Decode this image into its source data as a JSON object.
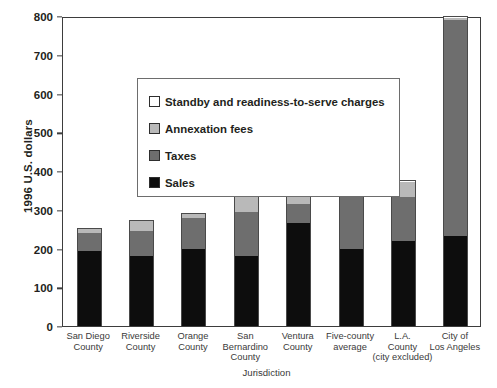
{
  "chart_data": {
    "type": "bar",
    "subtype": "stacked-bar",
    "title": "",
    "xlabel": "Jurisdiction",
    "ylabel": "1996 U.S. dollars",
    "ylim": [
      0,
      800
    ],
    "ytick_values": [
      0,
      100,
      200,
      300,
      400,
      500,
      600,
      700,
      800
    ],
    "ytick_labels": [
      "0",
      "100",
      "200",
      "300",
      "400",
      "500",
      "600",
      "700",
      "800"
    ],
    "grid": false,
    "legend_position": "upper-left-inside",
    "categories": [
      "San Diego County",
      "Riverside County",
      "Orange County",
      "San Bernardino County",
      "Ventura County",
      "Five-county average",
      "L.A. County (city excluded)",
      "City of Los Angeles"
    ],
    "category_lines": [
      [
        "San Diego",
        "County"
      ],
      [
        "Riverside",
        "County"
      ],
      [
        "Orange",
        "County"
      ],
      [
        "San",
        "Bernardino",
        "County"
      ],
      [
        "Ventura",
        "County"
      ],
      [
        "Five-county",
        "average"
      ],
      [
        "L.A.",
        "County",
        "(city excluded)"
      ],
      [
        "City of",
        "Los Angeles"
      ]
    ],
    "series": [
      {
        "name": "Sales",
        "color": "#0d0d0d",
        "values": [
          193,
          180,
          198,
          180,
          265,
          198,
          220,
          232
        ]
      },
      {
        "name": "Taxes",
        "color": "#6e6e6e",
        "values": [
          48,
          65,
          82,
          113,
          50,
          135,
          112,
          558
        ]
      },
      {
        "name": "Annexation fees",
        "color": "#b9b9b9",
        "values": [
          12,
          25,
          10,
          42,
          25,
          20,
          40,
          6
        ]
      },
      {
        "name": "Standby and readiness-to-serve charges",
        "color": "#ffffff",
        "values": [
          0,
          3,
          2,
          7,
          3,
          2,
          5,
          3
        ]
      }
    ],
    "totals": [
      253,
      273,
      292,
      342,
      343,
      355,
      377,
      799
    ],
    "legend_entries": [
      "Standby and readiness-to-serve charges",
      "Annexation fees",
      "Taxes",
      "Sales"
    ]
  }
}
